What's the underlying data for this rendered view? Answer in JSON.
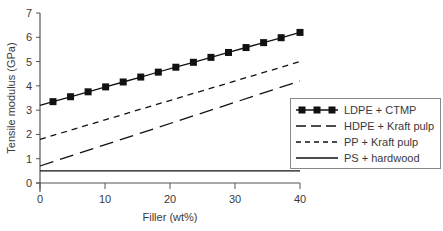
{
  "chart_data": {
    "type": "line",
    "title": "",
    "xlabel": "Filler (wt%)",
    "ylabel": "Tensile modulus (GPa)",
    "xlim": [
      0,
      40
    ],
    "ylim": [
      0,
      7
    ],
    "xticks": [
      0,
      10,
      20,
      30,
      40
    ],
    "yticks": [
      0,
      1,
      2,
      3,
      4,
      5,
      6,
      7
    ],
    "grid": false,
    "legend_position": "right, inside lower-right",
    "series": [
      {
        "name": "LDPE + CTMP",
        "style": "solid-square-markers",
        "color": "#111111",
        "x": [
          0,
          2,
          4.7,
          7.4,
          10.1,
          12.8,
          15.5,
          18.2,
          20.9,
          23.6,
          26.3,
          29,
          31.7,
          34.4,
          37.1,
          40
        ],
        "y": [
          3.2,
          3.35,
          3.55,
          3.75,
          3.96,
          4.16,
          4.36,
          4.57,
          4.77,
          4.97,
          5.17,
          5.38,
          5.58,
          5.78,
          5.98,
          6.2
        ],
        "markers_x": [
          2,
          4.7,
          7.4,
          10.1,
          12.8,
          15.5,
          18.2,
          20.9,
          23.6,
          26.3,
          29,
          31.7,
          34.4,
          37.1,
          40
        ]
      },
      {
        "name": "HDPE + Kraft pulp",
        "style": "long-dash",
        "color": "#111111",
        "x": [
          0,
          40
        ],
        "y": [
          0.7,
          4.2
        ]
      },
      {
        "name": "PP + Kraft pulp",
        "style": "short-dash",
        "color": "#111111",
        "x": [
          0,
          40
        ],
        "y": [
          1.8,
          5.0
        ]
      },
      {
        "name": "PS + hardwood",
        "style": "solid",
        "color": "#111111",
        "x": [
          0,
          40
        ],
        "y": [
          0.5,
          0.5
        ]
      }
    ]
  }
}
